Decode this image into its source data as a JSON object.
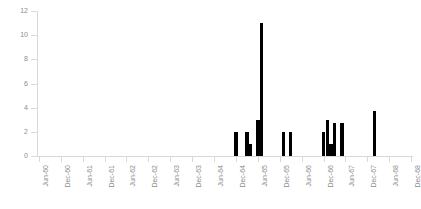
{
  "chart_data": {
    "type": "bar",
    "title": "",
    "subtitle": "",
    "xlabel": "",
    "ylabel": "",
    "ylim": [
      0,
      12
    ],
    "ytick_values": [
      0,
      2,
      4,
      6,
      8,
      10,
      12
    ],
    "ytick_labels": [
      "0",
      "2",
      "4",
      "6",
      "8",
      "10",
      "12"
    ],
    "grid": false,
    "legend": false,
    "xtick_labels": [
      "Jun-60",
      "Dec-60",
      "Jun-61",
      "Dec-61",
      "Jun-62",
      "Dec-62",
      "Jun-63",
      "Dec-63",
      "Jun-64",
      "Dec-64",
      "Jun-65",
      "Dec-65",
      "Jun-66",
      "Dec-66",
      "Jun-67",
      "Dec-67",
      "Jun-68",
      "Dec-68"
    ],
    "bar_color": "#000000",
    "axis_color": "#d9d9d9",
    "tick_label_color": "#8c8c8c",
    "categories": [
      "Jun-60",
      "Jul-60",
      "Aug-60",
      "Sep-60",
      "Oct-60",
      "Nov-60",
      "Dec-60",
      "Jan-61",
      "Feb-61",
      "Mar-61",
      "Apr-61",
      "May-61",
      "Jun-61",
      "Jul-61",
      "Aug-61",
      "Sep-61",
      "Oct-61",
      "Nov-61",
      "Dec-61",
      "Jan-62",
      "Feb-62",
      "Mar-62",
      "Apr-62",
      "May-62",
      "Jun-62",
      "Jul-62",
      "Aug-62",
      "Sep-62",
      "Oct-62",
      "Nov-62",
      "Dec-62",
      "Jan-63",
      "Feb-63",
      "Mar-63",
      "Apr-63",
      "May-63",
      "Jun-63",
      "Jul-63",
      "Aug-63",
      "Sep-63",
      "Oct-63",
      "Nov-63",
      "Dec-63",
      "Jan-64",
      "Feb-64",
      "Mar-64",
      "Apr-64",
      "May-64",
      "Jun-64",
      "Jul-64",
      "Aug-64",
      "Sep-64",
      "Oct-64",
      "Nov-64",
      "Dec-64",
      "Jan-65",
      "Feb-65",
      "Mar-65",
      "Apr-65",
      "May-65",
      "Jun-65",
      "Jul-65",
      "Aug-65",
      "Sep-65",
      "Oct-65",
      "Nov-65",
      "Dec-65",
      "Jan-66",
      "Feb-66",
      "Mar-66",
      "Apr-66",
      "May-66",
      "Jun-66",
      "Jul-66",
      "Aug-66",
      "Sep-66",
      "Oct-66",
      "Nov-66",
      "Dec-66",
      "Jan-67",
      "Feb-67",
      "Mar-67",
      "Apr-67",
      "May-67",
      "Jun-67",
      "Jul-67",
      "Aug-67",
      "Sep-67",
      "Oct-67",
      "Nov-67",
      "Dec-67",
      "Jan-68",
      "Feb-68",
      "Mar-68",
      "Apr-68",
      "May-68",
      "Jun-68",
      "Jul-68",
      "Aug-68",
      "Sep-68",
      "Oct-68",
      "Nov-68",
      "Dec-68"
    ],
    "values": [
      0,
      0,
      0,
      0,
      0,
      0,
      0,
      0,
      0,
      0,
      0,
      0,
      0,
      0,
      0,
      0,
      0,
      0,
      0,
      0,
      0,
      0,
      0,
      0,
      0,
      0,
      0,
      0,
      0,
      0,
      0,
      0,
      0,
      0,
      0,
      0,
      0,
      0,
      0,
      0,
      0,
      0,
      0,
      0,
      0,
      0,
      0,
      0,
      0,
      0,
      0,
      0,
      0,
      0,
      2,
      0,
      0,
      2,
      1,
      0,
      3,
      11,
      0,
      0,
      0,
      0,
      0,
      2,
      0,
      2,
      0,
      0,
      0,
      0,
      0,
      0,
      0,
      0,
      2,
      3,
      1,
      2.7,
      0,
      2.7,
      0,
      0,
      0,
      0,
      0,
      0,
      0,
      0,
      3.7,
      0,
      0,
      0,
      0,
      0,
      0,
      0,
      0,
      0,
      0
    ],
    "bars": [
      {
        "label": "Dec-64",
        "value": 2
      },
      {
        "label": "Mar-65",
        "value": 2
      },
      {
        "label": "Apr-65",
        "value": 1
      },
      {
        "label": "Jun-65",
        "value": 3
      },
      {
        "label": "Jul-65",
        "value": 11
      },
      {
        "label": "Jan-66",
        "value": 2
      },
      {
        "label": "Mar-66",
        "value": 2
      },
      {
        "label": "Dec-66",
        "value": 2
      },
      {
        "label": "Jan-67",
        "value": 3
      },
      {
        "label": "Feb-67",
        "value": 1
      },
      {
        "label": "Mar-67",
        "value": 2.7
      },
      {
        "label": "May-67",
        "value": 2.7
      },
      {
        "label": "Feb-68",
        "value": 3.7
      }
    ]
  }
}
